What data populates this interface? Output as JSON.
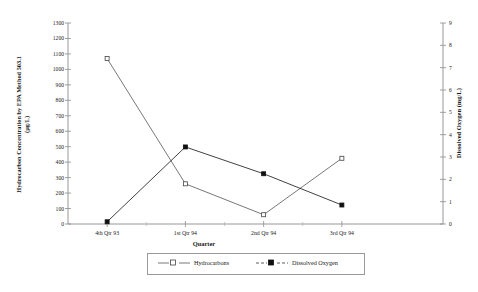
{
  "chart_data": {
    "type": "line",
    "title": "",
    "categories": [
      "4th Qtr 93",
      "1st Qtr 94",
      "2nd Qtr 94",
      "3rd Qtr 94"
    ],
    "xlabel": "Quarter",
    "grid": false,
    "legend_position": "bottom",
    "axes": {
      "left": {
        "label": "Hydrocarbon Concentration by EPA Method 503.1 (µg/L)",
        "label_line1": "Hydrocarbon Concentration by EPA Method 503.1",
        "label_line2": "(µg/L)",
        "ylim": [
          0,
          1300
        ],
        "tick_step": 100,
        "ticks": [
          "0",
          "100",
          "200",
          "300",
          "400",
          "500",
          "600",
          "700",
          "800",
          "900",
          "1000",
          "1100",
          "1200",
          "1300"
        ]
      },
      "right": {
        "label": "Dissolved Oxygen (mg/L)",
        "ylim": [
          0,
          9
        ],
        "tick_step": 1,
        "ticks": [
          "0",
          "1",
          "2",
          "3",
          "4",
          "5",
          "6",
          "7",
          "8",
          "9"
        ]
      }
    },
    "series": [
      {
        "name": "Hydrocarbons",
        "axis": "left",
        "marker": "open-square",
        "line_style": "solid",
        "color": "#555555",
        "values": [
          1070,
          260,
          60,
          425
        ]
      },
      {
        "name": "Dissolved Oxygen",
        "axis": "right",
        "marker": "filled-square",
        "line_style": "dashed",
        "color": "#111111",
        "values": [
          0.1,
          3.45,
          2.25,
          0.85
        ]
      }
    ]
  },
  "legend": {
    "items": [
      {
        "label": "Hydrocarbons"
      },
      {
        "label": "Dissolved Oxygen"
      }
    ]
  }
}
